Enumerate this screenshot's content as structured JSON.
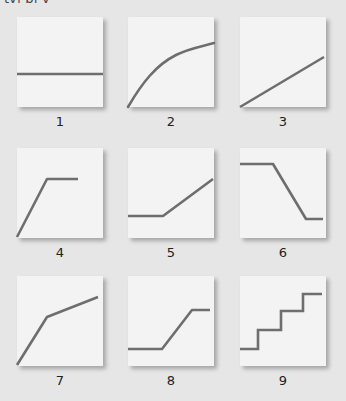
{
  "top_text": "ty| p| y",
  "style": {
    "background": "#e6e6e6",
    "panel_fill": "#f3f3f3",
    "line_color": "#6e6e6e"
  },
  "panels": [
    {
      "id": 1,
      "label": "1",
      "shape": "constant (horizontal line)",
      "points": "0,57 86,57"
    },
    {
      "id": 2,
      "label": "2",
      "shape": "concave increasing curve",
      "path": "M0,90 C14,66 28,48 48,38 C62,31 72,30 86,26"
    },
    {
      "id": 3,
      "label": "3",
      "shape": "linear increasing",
      "points": "0,90 84,40"
    },
    {
      "id": 4,
      "label": "4",
      "shape": "rise then plateau",
      "points": "0,89 30,31 61,31"
    },
    {
      "id": 5,
      "label": "5",
      "shape": "flat then rise",
      "points": "0,68 35,68 85,31"
    },
    {
      "id": 6,
      "label": "6",
      "shape": "flat, decline, flat",
      "points": "0,16 33,16 66,71 83,71"
    },
    {
      "id": 7,
      "label": "7",
      "shape": "steep rise then gentler rise",
      "points": "0,89 30,41 81,21"
    },
    {
      "id": 8,
      "label": "8",
      "shape": "flat, rise, flat (S-step)",
      "points": "0,73 34,73 64,34 82,34"
    },
    {
      "id": 9,
      "label": "9",
      "shape": "staircase",
      "points": "0,73 18,73 18,54 41,54 41,35 63,35 63,18 82,18"
    }
  ]
}
